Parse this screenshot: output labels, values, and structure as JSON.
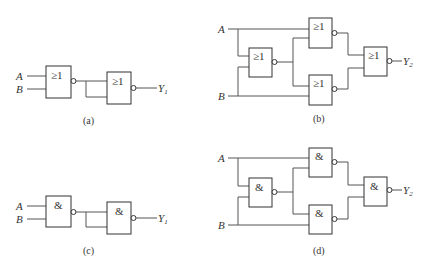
{
  "diagrams": [
    {
      "id": "a",
      "caption": "(a)",
      "gate_symbol": "≥1",
      "inputs": [
        "A",
        "B"
      ],
      "output": "Y",
      "output_sub": "1"
    },
    {
      "id": "b",
      "caption": "(b)",
      "gate_symbol": "≥1",
      "inputs": [
        "A",
        "B"
      ],
      "output": "Y",
      "output_sub": "2"
    },
    {
      "id": "c",
      "caption": "(c)",
      "gate_symbol": "&",
      "inputs": [
        "A",
        "B"
      ],
      "output": "Y",
      "output_sub": "1"
    },
    {
      "id": "d",
      "caption": "(d)",
      "gate_symbol": "&",
      "inputs": [
        "A",
        "B"
      ],
      "output": "Y",
      "output_sub": "2"
    }
  ]
}
